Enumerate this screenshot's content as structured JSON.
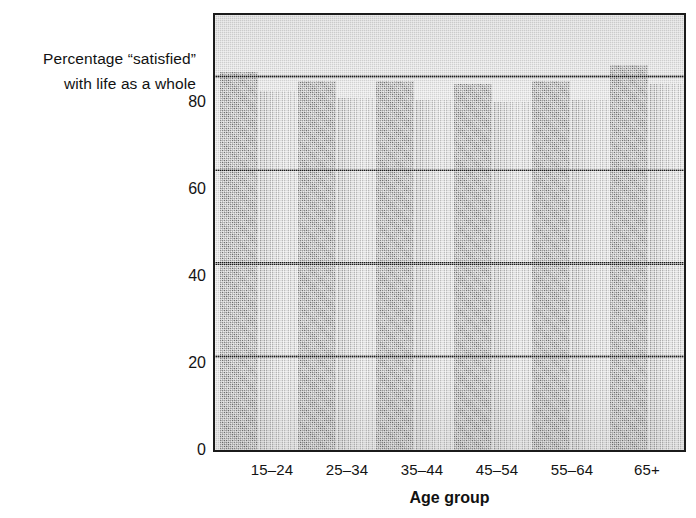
{
  "chart_data": {
    "type": "bar",
    "title": "",
    "subtitle": "",
    "ylabel_line1": "Percentage “satisfied”",
    "ylabel_line2": "with life as a whole",
    "xlabel": "Age group",
    "categories": [
      "15–24",
      "25–34",
      "35–44",
      "45–54",
      "55–64",
      "65+"
    ],
    "ylim": [
      0,
      93
    ],
    "yticks": [
      0,
      20,
      40,
      60,
      80
    ],
    "ytick_labels": [
      "0",
      "20",
      "40",
      "60",
      "80"
    ],
    "grid": "horizontal",
    "legend": "none",
    "series": [
      {
        "name": "series-1",
        "color": "#8f8f8f",
        "values": [
          81,
          79,
          79,
          78.5,
          79,
          82.5
        ]
      },
      {
        "name": "series-2",
        "color": "#bdbdbd",
        "values": [
          77,
          75.5,
          75,
          74.5,
          75,
          78.5
        ]
      }
    ]
  },
  "axis": {
    "ytick_0": "0",
    "ytick_20": "20",
    "ytick_40": "40",
    "ytick_60": "60",
    "ytick_80": "80"
  },
  "labels": {
    "cat_0": "15–24",
    "cat_1": "25–34",
    "cat_2": "35–44",
    "cat_3": "45–54",
    "cat_4": "55–64",
    "cat_5": "65+"
  }
}
